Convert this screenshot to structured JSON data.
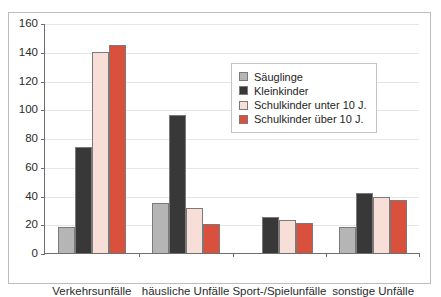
{
  "chart_data": {
    "type": "bar",
    "title": "",
    "xlabel": "",
    "ylabel": "",
    "ylim": [
      0,
      160
    ],
    "yticks": [
      0,
      20,
      40,
      60,
      80,
      100,
      120,
      140,
      160
    ],
    "grid": true,
    "legend_position": "inside-top-right",
    "categories": [
      "Verkehrsunfälle",
      "häusliche Unfälle",
      "Sport-/Spielunfälle",
      "sonstige Unfälle"
    ],
    "series": [
      {
        "name": "Säuglinge",
        "color": "#b5b5b5",
        "values": [
          18,
          35,
          null,
          18
        ]
      },
      {
        "name": "Kleinkinder",
        "color": "#383838",
        "values": [
          74,
          96,
          25,
          42
        ]
      },
      {
        "name": "Schulkinder unter 10 J.",
        "color": "#f7ded6",
        "values": [
          140,
          31,
          23,
          39
        ]
      },
      {
        "name": "Schulkinder über 10 J.",
        "color": "#d9503c",
        "values": [
          145,
          20,
          21,
          37
        ]
      }
    ]
  }
}
